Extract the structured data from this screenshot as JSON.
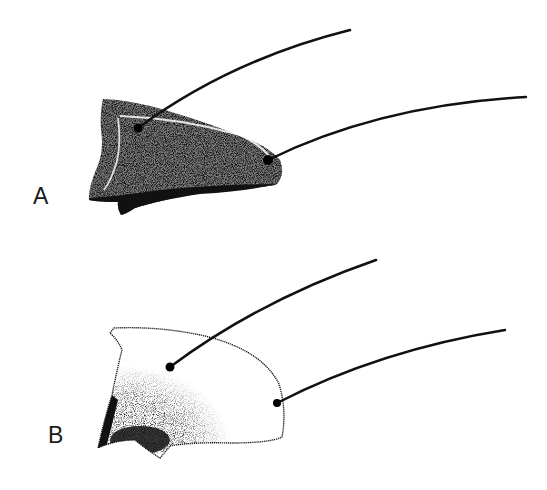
{
  "figure": {
    "panels": [
      {
        "label": "A",
        "description": "Fully stippled segment with two setae"
      },
      {
        "label": "B",
        "description": "Partially stippled (basal) segment with two setae"
      }
    ]
  },
  "colors": {
    "ink": "#1a1a1a",
    "background": "#ffffff"
  }
}
